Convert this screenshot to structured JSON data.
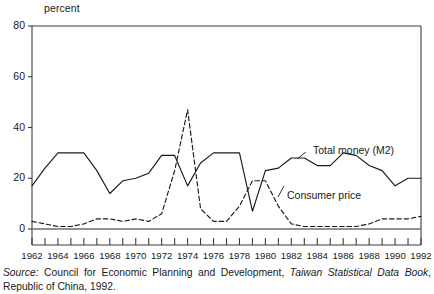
{
  "chart_data": {
    "type": "line",
    "title": "",
    "xlabel": "",
    "ylabel": "percent",
    "ylim": [
      0,
      80
    ],
    "xlim": [
      1962,
      1992
    ],
    "yticks": [
      0,
      20,
      40,
      60,
      80
    ],
    "xticks": [
      1962,
      1964,
      1966,
      1968,
      1970,
      1972,
      1974,
      1976,
      1978,
      1980,
      1982,
      1984,
      1986,
      1988,
      1990,
      1992
    ],
    "grid": false,
    "legend_position": "inline-annotation",
    "x": [
      1962,
      1963,
      1964,
      1965,
      1966,
      1967,
      1968,
      1969,
      1970,
      1971,
      1972,
      1973,
      1974,
      1975,
      1976,
      1977,
      1978,
      1979,
      1980,
      1981,
      1982,
      1983,
      1984,
      1985,
      1986,
      1987,
      1988,
      1989,
      1990,
      1991,
      1992
    ],
    "series": [
      {
        "name": "Total money (M2)",
        "style": "solid",
        "color": "#1a1a1a",
        "values": [
          17,
          24,
          30,
          30,
          30,
          23,
          14,
          19,
          20,
          22,
          29,
          29,
          17,
          26,
          30,
          30,
          30,
          7,
          23,
          24,
          28,
          28,
          25,
          25,
          30,
          29,
          25,
          23,
          17,
          20,
          20
        ]
      },
      {
        "name": "Consumer price",
        "style": "dashed",
        "color": "#1a1a1a",
        "values": [
          3,
          2,
          1,
          1,
          2,
          4,
          4,
          3,
          4,
          3,
          6,
          23,
          47,
          8,
          3,
          3,
          9,
          19,
          19,
          9,
          2,
          1,
          1,
          1,
          1,
          1,
          2,
          4,
          4,
          4,
          5
        ]
      }
    ],
    "annotations": [
      {
        "label": "Total money (M2)",
        "series": "Total money (M2)"
      },
      {
        "label": "Consumer price",
        "series": "Consumer price"
      }
    ]
  },
  "axis": {
    "unit_label": "percent",
    "ytick_labels": [
      "80",
      "60",
      "40",
      "20",
      "0"
    ],
    "xtick_labels": [
      "1962",
      "1964",
      "1966",
      "1968",
      "1970",
      "1972",
      "1974",
      "1976",
      "1978",
      "1980",
      "1982",
      "1984",
      "1986",
      "1988",
      "1990",
      "1992"
    ]
  },
  "annotations": {
    "total_money": "Total money (M2)",
    "consumer_price": "Consumer price"
  },
  "source": {
    "label": "Source:",
    "text_before": " Council for Economic Planning and Development, ",
    "publication": "Taiwan Statistical Data Book",
    "text_after": ", Republic of China, 1992."
  }
}
